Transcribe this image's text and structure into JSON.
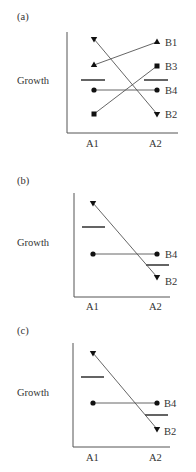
{
  "panels": [
    {
      "label": "(a)",
      "ylabel": "Growth",
      "xticks": [
        "A1",
        "A2"
      ],
      "series": [
        {
          "name": "B1",
          "marker": "triangle-up",
          "a1": 65,
          "a2": 42
        },
        {
          "name": "B2",
          "marker": "triangle-down",
          "a1": 39,
          "a2": 114
        },
        {
          "name": "B3",
          "marker": "square",
          "a1": 114,
          "a2": 66
        },
        {
          "name": "B4",
          "marker": "circle",
          "a1": 90,
          "a2": 90
        }
      ],
      "mean_dashes": {
        "a1": 80,
        "a2": 80
      }
    },
    {
      "label": "(b)",
      "ylabel": "Growth",
      "xticks": [
        "A1",
        "A2"
      ],
      "series": [
        {
          "name": "B4",
          "marker": "circle",
          "a1": 254,
          "a2": 254
        },
        {
          "name": "B2",
          "marker": "triangle-down",
          "a1": 203,
          "a2": 277
        }
      ],
      "mean_dashes": {
        "a1": 227,
        "a2": 265
      }
    },
    {
      "label": "(c)",
      "ylabel": "Growth",
      "xticks": [
        "A1",
        "A2"
      ],
      "series": [
        {
          "name": "B4",
          "marker": "circle",
          "a1": 403,
          "a2": 403
        },
        {
          "name": "B2",
          "marker": "triangle-down",
          "a1": 353,
          "a2": 429
        }
      ],
      "mean_dashes": {
        "a1": 377,
        "a2": 415
      }
    }
  ]
}
